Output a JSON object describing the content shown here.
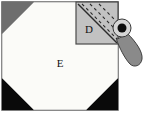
{
  "figure": {
    "canvas": {
      "width": 155,
      "height": 120,
      "background": "#ffffff"
    },
    "frame": {
      "name": "outer-square-frame",
      "x": 2,
      "y": 2,
      "width": 116,
      "height": 108,
      "stroke": "#555555",
      "stroke_width": 1.5,
      "fill": "#ffffff"
    },
    "regions": [
      {
        "id": "region-E",
        "label": "E",
        "shape": "octagon",
        "fill": "#fbfbf8",
        "stroke": "#9a9a9a",
        "label_x": 60,
        "label_y": 64,
        "points": "2,34 34,2 86,2 118,34 118,78 86,110 34,110 2,78"
      },
      {
        "id": "corner-top-left",
        "label": "",
        "shape": "triangle",
        "fill": "#6e6e6e",
        "stroke": "none",
        "points": "2,2 34,2 2,34"
      },
      {
        "id": "corner-bottom-left",
        "label": "",
        "shape": "triangle",
        "fill": "#0a0a0a",
        "stroke": "none",
        "points": "2,78 34,110 2,110"
      },
      {
        "id": "corner-bottom-right",
        "label": "",
        "shape": "triangle",
        "fill": "#0a0a0a",
        "stroke": "none",
        "points": "118,78 118,110 86,110"
      },
      {
        "id": "region-D",
        "label": "D",
        "shape": "square",
        "fill": "#c2c2c2",
        "stroke": "#4a4a4a",
        "stroke_width": 1.2,
        "x": 76,
        "y": 2,
        "width": 42,
        "height": 42,
        "label_x": 89,
        "label_y": 30
      }
    ],
    "region_d_lines": {
      "name": "diagonal-cut-line",
      "solid": {
        "x1": 78,
        "y1": 4,
        "x2": 117,
        "y2": 43,
        "stroke": "#2b2b2b",
        "stroke_width": 1.4
      },
      "dashes": [
        {
          "x1": 82,
          "y1": 4,
          "x2": 117,
          "y2": 39
        },
        {
          "x1": 90,
          "y1": 4,
          "x2": 117,
          "y2": 31
        },
        {
          "x1": 99,
          "y1": 4,
          "x2": 117,
          "y2": 22
        }
      ],
      "dash_stroke": "#2b2b2b",
      "dash_width": 1.1,
      "dash_pattern": "3,3"
    },
    "knob": {
      "name": "rotating-knob-handle",
      "pivot_x": 122,
      "pivot_y": 28,
      "outer_radius": 9,
      "outer_fill": "#d6d6d6",
      "outer_stroke": "#3a3a3a",
      "hub_radius": 4.5,
      "hub_fill": "#0d0d0d",
      "handle_fill": "#8a8a8a",
      "handle_stroke": "#3f3f3f",
      "handle_path": "M 127.5 33.5 C 136 42 143 52 142 59 C 141 66 134 68 130 64 C 125 59 119 47 116.5 39.5 Z"
    },
    "labels": {
      "region_e": "E",
      "region_d": "D"
    },
    "colors": {
      "background": "#ffffff",
      "octagon_fill": "#fbfbf8",
      "corner_gray": "#6e6e6e",
      "corner_black": "#0a0a0a",
      "region_d_fill": "#c2c2c2",
      "knob_gray": "#8a8a8a",
      "hub_black": "#0d0d0d",
      "frame_stroke": "#555555"
    }
  }
}
